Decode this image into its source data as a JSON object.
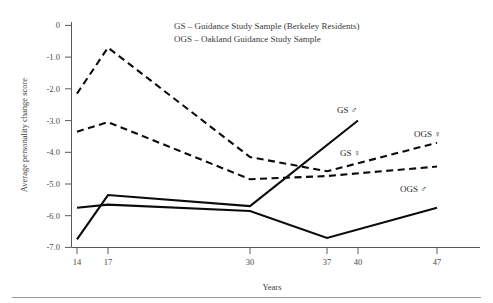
{
  "chart_data": {
    "type": "line",
    "title": "",
    "xlabel": "Years",
    "ylabel": "Average personality change score",
    "x_ticks": [
      "14",
      "17",
      "30",
      "37",
      "40",
      "47"
    ],
    "x_tick_values": [
      14,
      17,
      30,
      37,
      40,
      47
    ],
    "y_ticks": [
      "0",
      "-1.0",
      "-2.0",
      "-3.0",
      "-4.0",
      "-5.0",
      "-6.0",
      "-7.0"
    ],
    "y_tick_values": [
      0,
      -1.0,
      -2.0,
      -3.0,
      -4.0,
      -5.0,
      -6.0,
      -7.0
    ],
    "ylim": [
      -7.0,
      0
    ],
    "grid": false,
    "legend_position": "inside-top-center",
    "series": [
      {
        "name": "OGS ♀",
        "label": "OGS ♀",
        "style": "dashed",
        "x": [
          14,
          17,
          30,
          37,
          47
        ],
        "values": [
          -2.15,
          -0.7,
          -4.15,
          -4.6,
          -3.7
        ]
      },
      {
        "name": "GS ♀",
        "label": "GS ♀",
        "style": "dashed",
        "x": [
          14,
          17,
          30,
          37,
          47
        ],
        "values": [
          -3.35,
          -3.05,
          -4.85,
          -4.75,
          -4.45
        ]
      },
      {
        "name": "GS ♂",
        "label": "GS ♂",
        "style": "solid",
        "x": [
          14,
          17,
          30,
          40
        ],
        "values": [
          -6.75,
          -5.35,
          -5.7,
          -3.0
        ]
      },
      {
        "name": "OGS ♂",
        "label": "OGS ♂",
        "style": "solid",
        "x": [
          14,
          17,
          30,
          37,
          47
        ],
        "values": [
          -5.75,
          -5.65,
          -5.85,
          -6.7,
          -5.75
        ]
      }
    ],
    "annotations": [
      {
        "text": "GS ♂",
        "x": 40,
        "y": -2.6
      },
      {
        "text": "OGS ♀",
        "x": 47,
        "y": -3.15
      },
      {
        "text": "GS ♀",
        "x": 37,
        "y": -4.25
      },
      {
        "text": "OGS ♂",
        "x": 47,
        "y": -5.3
      }
    ]
  },
  "legend": {
    "line1": "GS – Guidance Study Sample (Berkeley Residents)",
    "line2": "OGS – Oakland Guidance Study Sample"
  },
  "labels": {
    "gs_male": "GS ♂",
    "gs_female": "GS ♀",
    "ogs_male": "OGS ♂",
    "ogs_female": "OGS ♀",
    "x_axis_title": "Years",
    "y_axis_title": "Average personality change score"
  },
  "colors": {
    "line": "#0b0b0b",
    "axis": "#5a5a5a",
    "text": "#3a3a3a",
    "background": "#ffffff"
  }
}
